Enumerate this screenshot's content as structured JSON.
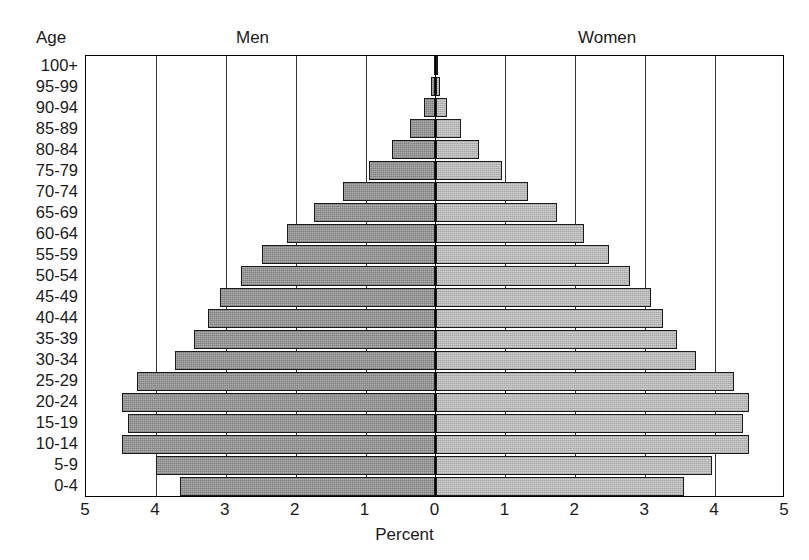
{
  "header": {
    "age_label": "Age",
    "men_label": "Men",
    "women_label": "Women"
  },
  "axis": {
    "x_title": "Percent",
    "x_ticks_left": [
      "5",
      "4",
      "3",
      "2",
      "1"
    ],
    "x_tick_center": "0",
    "x_ticks_right": [
      "1",
      "2",
      "3",
      "4",
      "5"
    ]
  },
  "chart_data": {
    "type": "bar",
    "subtype": "population-pyramid",
    "title": "",
    "xlabel": "Percent",
    "ylabel": "Age",
    "xlim": [
      -5,
      5
    ],
    "xticks": [
      5,
      4,
      3,
      2,
      1,
      0,
      1,
      2,
      3,
      4,
      5
    ],
    "grid": true,
    "legend_position": "top",
    "orientation": "horizontal",
    "categories": [
      "100+",
      "95-99",
      "90-94",
      "85-89",
      "80-84",
      "75-79",
      "70-74",
      "65-69",
      "60-64",
      "55-59",
      "50-54",
      "45-49",
      "40-44",
      "35-39",
      "30-34",
      "25-29",
      "20-24",
      "15-19",
      "10-14",
      "5-9",
      "0-4"
    ],
    "series": [
      {
        "name": "Men",
        "side": "left",
        "color": "#9a9a9a",
        "values": [
          0.02,
          0.06,
          0.17,
          0.37,
          0.62,
          0.95,
          1.33,
          1.74,
          2.13,
          2.48,
          2.78,
          3.08,
          3.25,
          3.45,
          3.73,
          4.27,
          4.48,
          4.4,
          4.48,
          4.0,
          3.65
        ]
      },
      {
        "name": "Women",
        "side": "right",
        "color": "#c2c2c2",
        "values": [
          0.02,
          0.06,
          0.17,
          0.37,
          0.62,
          0.95,
          1.33,
          1.74,
          2.13,
          2.48,
          2.78,
          3.08,
          3.25,
          3.45,
          3.73,
          4.27,
          4.48,
          4.4,
          4.48,
          3.95,
          3.55
        ]
      }
    ]
  }
}
